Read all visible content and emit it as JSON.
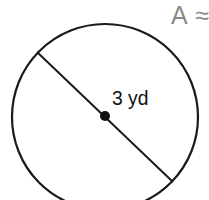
{
  "figure": {
    "shape": "circle",
    "stroke_color": "#1a1a1a",
    "fill_color": "#ffffff",
    "center": {
      "x": 105,
      "y": 117
    },
    "radius": 93,
    "diameter_line": {
      "x1": 37,
      "y1": 52,
      "x2": 173,
      "y2": 182
    },
    "center_dot_radius": 5,
    "measurement_label": "3 yd",
    "measurement_type": "radius"
  },
  "prompt": {
    "area_label": "A ≈",
    "label_color": "#8a8a8a"
  }
}
